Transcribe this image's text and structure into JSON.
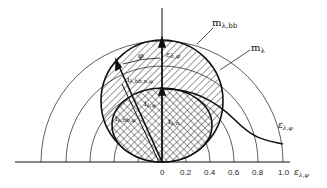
{
  "diagram": {
    "type": "polar emissivity diagram",
    "axis": {
      "ticks": [
        "0",
        "0.2",
        "0.4",
        "0.6",
        "0.8",
        "1.0"
      ],
      "x_label": "ε",
      "x_label_sub": "λ,φ"
    },
    "labels": {
      "m_bb": "m",
      "m_bb_sub": "λ,bb",
      "m": "m",
      "m_sub": "λ",
      "eps_curve": "ε",
      "eps_curve_sub": "λ,φ",
      "eps_vertical": "ε",
      "eps_vertical_sub": "λ,φ",
      "phi": "φ",
      "i_bb_n_phi": "i",
      "i_bb_n_phi_sub": "λ,bb,n,φ",
      "i_phi": "i",
      "i_phi_sub": "λ,φ",
      "i_bb_phi": "i",
      "i_bb_phi_sub": "λ,bb,φ",
      "i_n": "i",
      "i_n_sub": "λ,n"
    }
  }
}
